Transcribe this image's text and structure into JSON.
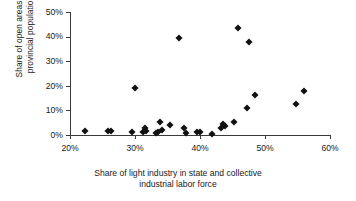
{
  "chart_data": {
    "type": "scatter",
    "title": "",
    "xlabel": "Share of light industry in state and collective\nindustrial labor force",
    "ylabel": "Share of open areas in\nprovincial population",
    "xlim": [
      20,
      60
    ],
    "ylim": [
      0,
      50
    ],
    "xticks": [
      20,
      30,
      40,
      50,
      60
    ],
    "yticks": [
      0,
      10,
      20,
      30,
      40,
      50
    ],
    "xtick_labels": [
      "20%",
      "30%",
      "40%",
      "50%",
      "60%"
    ],
    "ytick_labels": [
      "0%",
      "10%",
      "20%",
      "30%",
      "40%",
      "50%"
    ],
    "grid": false,
    "legend": false,
    "marker": "filled-diamond",
    "marker_color": "#111111",
    "axis_color": "#3a3a3a",
    "points": [
      {
        "x": 22.3,
        "y": 1.6
      },
      {
        "x": 25.8,
        "y": 1.8
      },
      {
        "x": 26.3,
        "y": 1.5
      },
      {
        "x": 29.6,
        "y": 1.2
      },
      {
        "x": 30.0,
        "y": 19.0
      },
      {
        "x": 31.2,
        "y": 1.4
      },
      {
        "x": 31.5,
        "y": 2.9
      },
      {
        "x": 31.7,
        "y": 1.8
      },
      {
        "x": 33.2,
        "y": 0.8
      },
      {
        "x": 33.5,
        "y": 1.2
      },
      {
        "x": 33.9,
        "y": 5.2
      },
      {
        "x": 34.1,
        "y": 2.1
      },
      {
        "x": 35.4,
        "y": 3.9
      },
      {
        "x": 36.8,
        "y": 39.5
      },
      {
        "x": 37.5,
        "y": 2.7
      },
      {
        "x": 37.8,
        "y": 0.7
      },
      {
        "x": 39.6,
        "y": 1.3
      },
      {
        "x": 40.0,
        "y": 1.2
      },
      {
        "x": 41.8,
        "y": 0.6
      },
      {
        "x": 43.2,
        "y": 2.8
      },
      {
        "x": 43.6,
        "y": 4.3
      },
      {
        "x": 43.8,
        "y": 3.7
      },
      {
        "x": 45.3,
        "y": 5.3
      },
      {
        "x": 45.8,
        "y": 43.5
      },
      {
        "x": 47.3,
        "y": 10.9
      },
      {
        "x": 47.5,
        "y": 38.0
      },
      {
        "x": 48.5,
        "y": 16.1
      },
      {
        "x": 54.8,
        "y": 12.8
      },
      {
        "x": 56.0,
        "y": 18.0
      }
    ]
  }
}
